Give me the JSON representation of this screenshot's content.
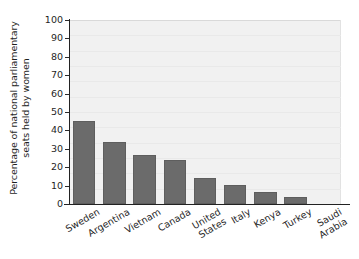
{
  "chart_data": {
    "type": "bar",
    "title": "",
    "subtitle": "",
    "xlabel": "",
    "ylabel": "Percentage of national parliamentary seats held by women",
    "ylabel_lines": [
      "Percentage of national parliamentary",
      "seats held by women"
    ],
    "categories": [
      "Sweden",
      "Argentina",
      "Vietnam",
      "Canada",
      "United States",
      "Italy",
      "Kenya",
      "Turkey",
      "Saudi Arabia"
    ],
    "category_lines": [
      [
        "Sweden"
      ],
      [
        "Argentina"
      ],
      [
        "Vietnam"
      ],
      [
        "Canada"
      ],
      [
        "United",
        "States"
      ],
      [
        "Italy"
      ],
      [
        "Kenya"
      ],
      [
        "Turkey"
      ],
      [
        "Saudi",
        "Arabia"
      ]
    ],
    "values": [
      45,
      33.5,
      26.5,
      24,
      14,
      10.5,
      6.5,
      4,
      0
    ],
    "ylim": [
      0,
      100
    ],
    "ytick_values": [
      0,
      10,
      20,
      30,
      40,
      50,
      60,
      70,
      80,
      90,
      100
    ],
    "ytick_labels": [
      "0",
      "10",
      "20",
      "30",
      "40",
      "50",
      "60",
      "70",
      "80",
      "90",
      "100"
    ],
    "grid": false,
    "legend": null,
    "legend_position": "none",
    "bar_color": "#6b6b6b",
    "plot_background": "#f1f1f1",
    "axis_color": "#222222",
    "text_color": "#1f1f1f"
  }
}
